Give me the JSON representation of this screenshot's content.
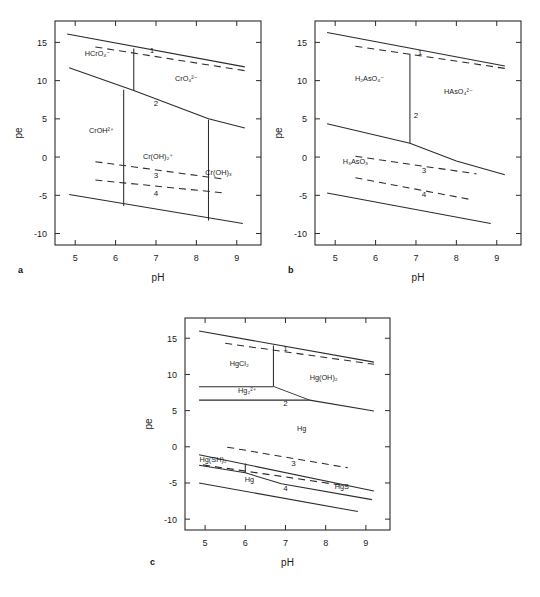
{
  "figure": {
    "panels": [
      "a",
      "b",
      "c"
    ]
  },
  "axes": {
    "xlabel": "pH",
    "ylabel": "pe",
    "xticks": [
      5,
      6,
      7,
      8,
      9
    ],
    "yticks": [
      15,
      10,
      5,
      0,
      -5,
      -10
    ],
    "xlim": [
      4.5,
      9.6
    ],
    "ylim": [
      -11.5,
      17.8
    ],
    "xtick_labels": [
      "5",
      "6",
      "7",
      "8",
      "9"
    ],
    "ytick_labels": [
      "15",
      "10",
      "5",
      "0",
      "-5",
      "-10"
    ]
  },
  "chart_data": [
    {
      "type": "line",
      "panel": "a",
      "label": "a",
      "element": "Cr",
      "title": "",
      "xlabel": "pH",
      "ylabel": "pe",
      "xlim": [
        4.5,
        9.6
      ],
      "ylim": [
        -11.5,
        17.8
      ],
      "grid": false,
      "legend": "none",
      "species": [
        {
          "name": "HCrO4-",
          "display": "HCrO₄⁻",
          "x": 5.55,
          "y": 13.2
        },
        {
          "name": "CrO4 2-",
          "display": "CrO₄²⁻",
          "x": 7.75,
          "y": 9.9
        },
        {
          "name": "CrOH2+",
          "display": "CrOH²⁺",
          "x": 5.65,
          "y": 3.1
        },
        {
          "name": "Cr(OH)2+",
          "display": "Cr(OH)₂⁺",
          "x": 7.05,
          "y": -0.2
        },
        {
          "name": "Cr(OH)3",
          "display": "Cr(OH)₃",
          "x": 8.55,
          "y": -2.3
        }
      ],
      "boundary_numbers": [
        {
          "label": "1",
          "x": 6.9,
          "y": 13.6
        },
        {
          "label": "2",
          "x": 7.0,
          "y": 6.7
        },
        {
          "label": "3",
          "x": 7.0,
          "y": -2.7
        },
        {
          "label": "4",
          "x": 7.0,
          "y": -5.1
        }
      ],
      "series": [
        {
          "name": "O2/H2O upper stability (solid 1)",
          "style": "solid",
          "x": [
            4.8,
            9.2
          ],
          "y": [
            16.1,
            11.8
          ]
        },
        {
          "name": "dashed line 1",
          "style": "dashed",
          "x": [
            5.5,
            9.2
          ],
          "y": [
            14.4,
            11.3
          ]
        },
        {
          "name": "HCrO4-/CrO4 2- vertical",
          "style": "solid",
          "x": [
            6.45,
            6.45
          ],
          "y": [
            14.2,
            8.7
          ]
        },
        {
          "name": "redox boundary 2",
          "style": "solid",
          "x": [
            4.85,
            6.45,
            8.3,
            9.2
          ],
          "y": [
            11.7,
            8.7,
            5.0,
            3.8
          ]
        },
        {
          "name": "CrOH2+/Cr(OH)2+ vertical",
          "style": "solid",
          "x": [
            6.2,
            6.2
          ],
          "y": [
            8.8,
            -6.4
          ]
        },
        {
          "name": "Cr(OH)2+/Cr(OH)3 vertical",
          "style": "solid",
          "x": [
            8.3,
            8.3
          ],
          "y": [
            4.9,
            -8.3
          ]
        },
        {
          "name": "dashed line 3",
          "style": "dashed",
          "x": [
            5.5,
            8.7
          ],
          "y": [
            -0.6,
            -2.9
          ]
        },
        {
          "name": "dashed line 4",
          "style": "dashed",
          "x": [
            5.5,
            8.7
          ],
          "y": [
            -3.0,
            -4.7
          ]
        },
        {
          "name": "H2O/H2 lower stability (solid 4)",
          "style": "solid",
          "x": [
            4.85,
            9.15
          ],
          "y": [
            -4.9,
            -8.7
          ]
        }
      ]
    },
    {
      "type": "line",
      "panel": "b",
      "label": "b",
      "element": "As",
      "title": "",
      "xlabel": "pH",
      "ylabel": "pe",
      "xlim": [
        4.5,
        9.6
      ],
      "ylim": [
        -11.5,
        17.8
      ],
      "grid": false,
      "legend": "none",
      "species": [
        {
          "name": "H2AsO4-",
          "display": "H₂AsO₄⁻",
          "x": 5.85,
          "y": 10.0
        },
        {
          "name": "HAsO4 2-",
          "display": "HAsO₄²⁻",
          "x": 8.05,
          "y": 8.2
        },
        {
          "name": "H3AsO3",
          "display": "H₃AsO₃",
          "x": 5.5,
          "y": -0.9
        }
      ],
      "boundary_numbers": [
        {
          "label": "1",
          "x": 7.1,
          "y": 13.3
        },
        {
          "label": "2",
          "x": 7.0,
          "y": 5.1
        },
        {
          "label": "3",
          "x": 7.2,
          "y": -2.1
        },
        {
          "label": "4",
          "x": 7.2,
          "y": -5.2
        }
      ],
      "series": [
        {
          "name": "O2/H2O upper stability (solid 1)",
          "style": "solid",
          "x": [
            4.8,
            9.2
          ],
          "y": [
            16.3,
            11.9
          ]
        },
        {
          "name": "dashed line 1",
          "style": "dashed",
          "x": [
            5.5,
            9.2
          ],
          "y": [
            14.5,
            11.6
          ]
        },
        {
          "name": "H2AsO4-/HAsO4 2- vertical",
          "style": "solid",
          "x": [
            6.85,
            6.85
          ],
          "y": [
            13.5,
            1.8
          ]
        },
        {
          "name": "As(V)/As(III) redox boundary 2",
          "style": "solid",
          "x": [
            4.8,
            6.85,
            8.0,
            9.2
          ],
          "y": [
            4.35,
            1.8,
            -0.5,
            -2.3
          ]
        },
        {
          "name": "dashed line 3",
          "style": "dashed",
          "x": [
            5.5,
            8.5
          ],
          "y": [
            0.1,
            -2.2
          ]
        },
        {
          "name": "dashed line 4",
          "style": "dashed",
          "x": [
            5.5,
            8.4
          ],
          "y": [
            -2.7,
            -5.6
          ]
        },
        {
          "name": "H2O/H2 lower stability (solid 4)",
          "style": "solid",
          "x": [
            4.8,
            8.85
          ],
          "y": [
            -4.7,
            -8.7
          ]
        }
      ]
    },
    {
      "type": "line",
      "panel": "c",
      "label": "c",
      "element": "Hg",
      "title": "",
      "xlabel": "pH",
      "ylabel": "pe",
      "xlim": [
        4.5,
        9.6
      ],
      "ylim": [
        -11.5,
        17.8
      ],
      "grid": false,
      "legend": "none",
      "species": [
        {
          "name": "HgCl2",
          "display": "HgCl₂",
          "x": 5.85,
          "y": 11.2
        },
        {
          "name": "Hg(OH)2",
          "display": "Hg(OH)₂",
          "x": 7.95,
          "y": 9.3
        },
        {
          "name": "Hg2 2+",
          "display": "Hg₂²⁺",
          "x": 6.05,
          "y": 7.5
        },
        {
          "name": "Hg (elemental upper)",
          "display": "Hg",
          "x": 7.4,
          "y": 2.2
        },
        {
          "name": "Hg(SH)2",
          "display": "Hg(SH)₂",
          "x": 5.2,
          "y": -2.1
        },
        {
          "name": "Hg (elemental lower)",
          "display": "Hg",
          "x": 6.1,
          "y": -4.8
        },
        {
          "name": "HgS",
          "display": "HgS",
          "x": 8.4,
          "y": -5.9
        }
      ],
      "boundary_numbers": [
        {
          "label": "1",
          "x": 7.0,
          "y": 13.3
        },
        {
          "label": "2",
          "x": 7.0,
          "y": 5.6
        },
        {
          "label": "3",
          "x": 7.2,
          "y": -2.6
        },
        {
          "label": "4",
          "x": 7.0,
          "y": -6.1
        }
      ],
      "series": [
        {
          "name": "O2/H2O upper stability (solid 1)",
          "style": "solid",
          "x": [
            4.85,
            9.2
          ],
          "y": [
            16.0,
            11.7
          ]
        },
        {
          "name": "dashed line 1",
          "style": "dashed",
          "x": [
            5.5,
            9.2
          ],
          "y": [
            14.3,
            11.4
          ]
        },
        {
          "name": "HgCl2/Hg(OH)2 vertical",
          "style": "solid",
          "x": [
            6.7,
            6.7
          ],
          "y": [
            14.0,
            8.35
          ]
        },
        {
          "name": "HgCl2/Hg2 2+ horizontal",
          "style": "solid",
          "x": [
            4.85,
            6.7
          ],
          "y": [
            8.3,
            8.3
          ]
        },
        {
          "name": "Hg(OH)2 redox boundary 2",
          "style": "solid",
          "x": [
            6.7,
            7.6,
            9.2
          ],
          "y": [
            8.35,
            6.45,
            4.95
          ]
        },
        {
          "name": "Hg2 2+/Hg horizontal",
          "style": "solid",
          "x": [
            4.85,
            7.6
          ],
          "y": [
            6.45,
            6.45
          ]
        },
        {
          "name": "dashed line 3",
          "style": "dashed",
          "x": [
            5.55,
            8.55
          ],
          "y": [
            -0.05,
            -2.9
          ]
        },
        {
          "name": "Hg/Hg(SH)2-HgS boundary 3",
          "style": "solid",
          "x": [
            4.85,
            9.2
          ],
          "y": [
            -1.1,
            -6.1
          ]
        },
        {
          "name": "Hg(SH)2/Hg vertical tick",
          "style": "solid",
          "x": [
            6.0,
            6.0
          ],
          "y": [
            -2.3,
            -3.6
          ]
        },
        {
          "name": "dashed line 4",
          "style": "dashed",
          "x": [
            4.95,
            8.5
          ],
          "y": [
            -2.5,
            -5.4
          ]
        },
        {
          "name": "Hg(SH)2/HgS boundary",
          "style": "solid",
          "x": [
            4.85,
            6.0,
            6.9,
            9.15
          ],
          "y": [
            -2.55,
            -3.6,
            -5.1,
            -7.3
          ]
        },
        {
          "name": "H2O/H2 lower stability (solid 4)",
          "style": "solid",
          "x": [
            4.85,
            8.8
          ],
          "y": [
            -5.0,
            -8.95
          ]
        }
      ]
    }
  ]
}
